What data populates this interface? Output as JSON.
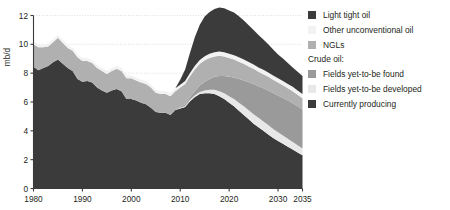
{
  "chart_data": {
    "type": "area",
    "stacked": true,
    "title": "",
    "subtitle": "",
    "xlabel": "",
    "ylabel": "mb/d",
    "xlim": [
      1980,
      2035
    ],
    "ylim": [
      0,
      12
    ],
    "y_ticks": [
      0,
      2,
      4,
      6,
      8,
      10,
      12
    ],
    "x_ticks": [
      1980,
      1990,
      2000,
      2010,
      2020,
      2030,
      2035
    ],
    "x_tick_labels": [
      "1980",
      "1990",
      "2000",
      "2010",
      "2020",
      "2030",
      "2035"
    ],
    "y_tick_labels": [
      "0",
      "2",
      "4",
      "6",
      "8",
      "10",
      "12"
    ],
    "grid": "horizontal-dotted",
    "legend_position": "right",
    "x": [
      1980,
      1981,
      1982,
      1983,
      1984,
      1985,
      1986,
      1987,
      1988,
      1989,
      1990,
      1991,
      1992,
      1993,
      1994,
      1995,
      1996,
      1997,
      1998,
      1999,
      2000,
      2001,
      2002,
      2003,
      2004,
      2005,
      2006,
      2007,
      2008,
      2009,
      2010,
      2011,
      2012,
      2013,
      2014,
      2015,
      2016,
      2017,
      2018,
      2019,
      2020,
      2021,
      2022,
      2023,
      2024,
      2025,
      2026,
      2027,
      2028,
      2029,
      2030,
      2031,
      2032,
      2033,
      2034,
      2035
    ],
    "series": [
      {
        "name": "Currently producing",
        "color": "#3b3b3b",
        "values": [
          8.45,
          8.2,
          8.35,
          8.5,
          8.75,
          8.95,
          8.65,
          8.35,
          8.15,
          7.6,
          7.4,
          7.45,
          7.35,
          7.0,
          6.8,
          6.65,
          6.8,
          6.9,
          6.75,
          6.2,
          6.2,
          6.1,
          5.95,
          5.85,
          5.6,
          5.3,
          5.25,
          5.25,
          5.1,
          5.45,
          5.55,
          5.65,
          6.05,
          6.35,
          6.55,
          6.6,
          6.6,
          6.55,
          6.4,
          6.2,
          5.95,
          5.7,
          5.4,
          5.1,
          4.8,
          4.5,
          4.25,
          4.0,
          3.75,
          3.5,
          3.3,
          3.1,
          2.9,
          2.7,
          2.5,
          2.3
        ]
      },
      {
        "name": "Fields yet-to-be developed",
        "color": "#e8e8e8",
        "values": [
          0,
          0,
          0,
          0,
          0,
          0,
          0,
          0,
          0,
          0,
          0,
          0,
          0,
          0,
          0,
          0,
          0,
          0,
          0,
          0,
          0,
          0,
          0,
          0,
          0,
          0,
          0,
          0,
          0,
          0,
          0.05,
          0.08,
          0.1,
          0.12,
          0.15,
          0.2,
          0.25,
          0.3,
          0.35,
          0.4,
          0.45,
          0.5,
          0.55,
          0.6,
          0.62,
          0.65,
          0.65,
          0.65,
          0.65,
          0.62,
          0.6,
          0.58,
          0.55,
          0.52,
          0.5,
          0.48
        ]
      },
      {
        "name": "Fields yet-to-be found",
        "color": "#9a9a9a",
        "values": [
          0,
          0,
          0,
          0,
          0,
          0,
          0,
          0,
          0,
          0,
          0,
          0,
          0,
          0,
          0,
          0,
          0,
          0,
          0,
          0,
          0,
          0,
          0,
          0,
          0,
          0,
          0,
          0,
          0,
          0,
          0.05,
          0.12,
          0.2,
          0.3,
          0.45,
          0.6,
          0.75,
          0.9,
          1.05,
          1.2,
          1.35,
          1.5,
          1.65,
          1.8,
          1.95,
          2.1,
          2.2,
          2.3,
          2.4,
          2.5,
          2.55,
          2.6,
          2.65,
          2.7,
          2.7,
          2.7
        ]
      },
      {
        "name": "NGLs",
        "color": "#b0b0b0",
        "values": [
          1.55,
          1.6,
          1.45,
          1.35,
          1.4,
          1.5,
          1.45,
          1.4,
          1.4,
          1.5,
          1.45,
          1.4,
          1.35,
          1.35,
          1.35,
          1.3,
          1.35,
          1.4,
          1.4,
          1.45,
          1.45,
          1.4,
          1.4,
          1.4,
          1.4,
          1.35,
          1.3,
          1.3,
          1.3,
          1.3,
          1.35,
          1.4,
          1.45,
          1.5,
          1.5,
          1.5,
          1.45,
          1.4,
          1.4,
          1.35,
          1.3,
          1.25,
          1.2,
          1.15,
          1.1,
          1.05,
          1.0,
          0.98,
          0.95,
          0.92,
          0.9,
          0.88,
          0.85,
          0.83,
          0.8,
          0.78
        ]
      },
      {
        "name": "Other unconventional oil",
        "color": "#f2f2f2",
        "values": [
          0.22,
          0.2,
          0.2,
          0.2,
          0.2,
          0.2,
          0.2,
          0.2,
          0.2,
          0.2,
          0.2,
          0.2,
          0.2,
          0.2,
          0.2,
          0.2,
          0.2,
          0.2,
          0.2,
          0.2,
          0.2,
          0.2,
          0.2,
          0.2,
          0.2,
          0.2,
          0.2,
          0.2,
          0.2,
          0.2,
          0.2,
          0.2,
          0.22,
          0.24,
          0.26,
          0.28,
          0.3,
          0.3,
          0.3,
          0.3,
          0.3,
          0.3,
          0.3,
          0.3,
          0.3,
          0.3,
          0.3,
          0.3,
          0.3,
          0.3,
          0.3,
          0.3,
          0.3,
          0.3,
          0.3,
          0.3
        ]
      },
      {
        "name": "Light tight oil",
        "color": "#3b3b3b",
        "values": [
          0,
          0,
          0,
          0,
          0,
          0,
          0,
          0,
          0,
          0,
          0,
          0,
          0,
          0,
          0,
          0,
          0,
          0,
          0,
          0,
          0,
          0,
          0,
          0,
          0,
          0,
          0,
          0,
          0,
          0,
          0.35,
          0.8,
          1.4,
          2.0,
          2.45,
          2.75,
          2.9,
          3.0,
          3.05,
          3.05,
          3.0,
          2.95,
          2.85,
          2.7,
          2.55,
          2.4,
          2.25,
          2.1,
          1.95,
          1.8,
          1.65,
          1.55,
          1.45,
          1.35,
          1.3,
          1.25
        ]
      }
    ]
  },
  "axes": {
    "y_axis_title": "mb/d"
  },
  "legend": {
    "items_top": [
      {
        "label": "Light tight oil",
        "color": "#3b3b3b"
      },
      {
        "label": "Other unconventional oil",
        "color": "#f2f2f2"
      },
      {
        "label": "NGLs",
        "color": "#b0b0b0"
      }
    ],
    "group_title": "Crude oil:",
    "items_crude": [
      {
        "label": "Fields yet-to-be found",
        "color": "#9a9a9a"
      },
      {
        "label": "Fields yet-to-be developed",
        "color": "#e8e8e8"
      },
      {
        "label": "Currently producing",
        "color": "#3b3b3b"
      }
    ]
  }
}
